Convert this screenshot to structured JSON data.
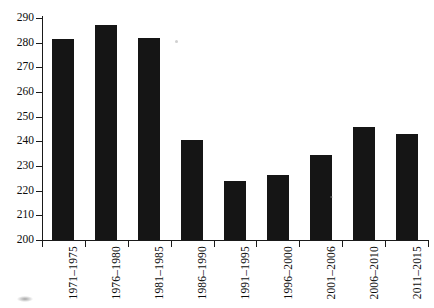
{
  "chart_data": {
    "type": "bar",
    "title": "",
    "subtitle": "",
    "xlabel": "",
    "ylabel": "",
    "categories": [
      "1971–1975",
      "1976–1980",
      "1981–1985",
      "1986–1990",
      "1991–1995",
      "1996–2000",
      "2001–2006",
      "2006–2010",
      "2011–2015"
    ],
    "values": [
      281.5,
      287,
      282,
      240.5,
      224,
      226.5,
      234.5,
      246,
      243
    ],
    "ylim": [
      200,
      290
    ],
    "ytick_values": [
      200,
      210,
      220,
      230,
      240,
      250,
      260,
      270,
      280,
      290
    ],
    "ytick_labels": [
      "200",
      "210",
      "220",
      "230",
      "240",
      "250",
      "260",
      "270",
      "280",
      "290"
    ],
    "grid": false,
    "legend": null,
    "legend_position": "none",
    "bar_color": "#151515",
    "axis_color": "#1a1a1a",
    "background_color": "#ffffff",
    "xtick_label_rotation": 90
  }
}
